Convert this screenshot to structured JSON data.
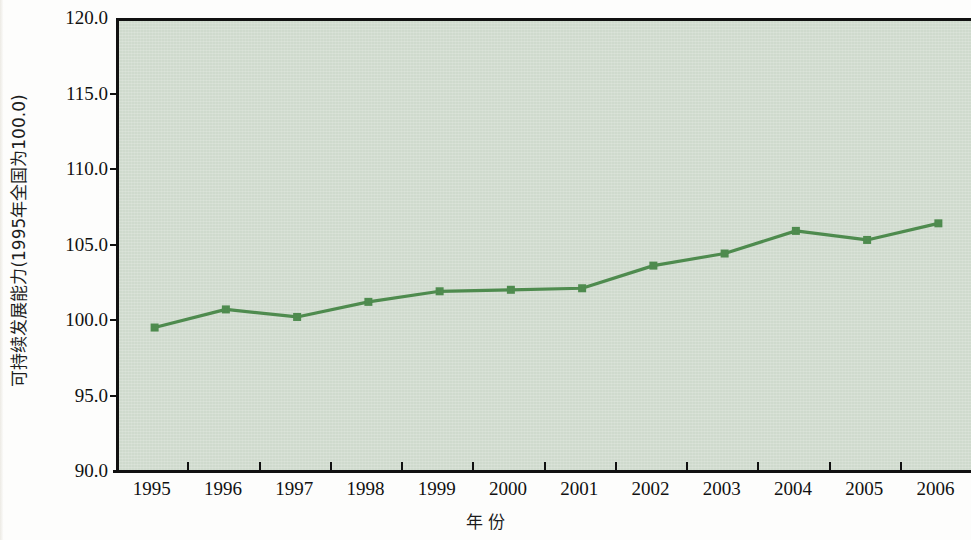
{
  "chart_data": {
    "type": "line",
    "title": "",
    "subtitle": "",
    "xlabel": "年 份",
    "ylabel": "可持续发展能力(1995年全国为100.0)",
    "categories": [
      "1995",
      "1996",
      "1997",
      "1998",
      "1999",
      "2000",
      "2001",
      "2002",
      "2003",
      "2004",
      "2005",
      "2006"
    ],
    "series": [
      {
        "name": "可持续发展能力",
        "values": [
          99.7,
          100.9,
          100.4,
          101.4,
          102.1,
          102.2,
          102.3,
          103.8,
          104.6,
          106.1,
          105.5,
          106.6
        ]
      }
    ],
    "ylim": [
      90.0,
      120.0
    ],
    "ytick_labels": [
      "120.0",
      "115.0",
      "110.0",
      "105.0",
      "100.0",
      "95.0",
      "90.0"
    ],
    "ytick_values": [
      120.0,
      115.0,
      110.0,
      105.0,
      100.0,
      95.0,
      90.0
    ],
    "grid": false,
    "legend": "none",
    "plot_background_color": "#cfdacd",
    "series_color": "#4e8b4e",
    "marker": "square",
    "axis_color": "#111111"
  }
}
